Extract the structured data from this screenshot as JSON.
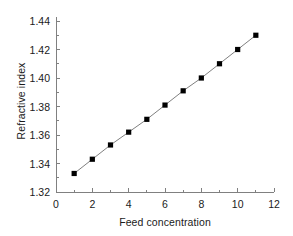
{
  "chart_data": {
    "type": "line",
    "title": "",
    "xlabel": "Feed concentration",
    "ylabel": "Refractive index",
    "x": [
      1,
      2,
      3,
      4,
      5,
      6,
      7,
      8,
      9,
      10,
      11
    ],
    "values": [
      1.333,
      1.343,
      1.353,
      1.362,
      1.371,
      1.381,
      1.391,
      1.4,
      1.41,
      1.42,
      1.43
    ],
    "series": [
      {
        "name": "Refractive index",
        "x": [
          1,
          2,
          3,
          4,
          5,
          6,
          7,
          8,
          9,
          10,
          11
        ],
        "values": [
          1.333,
          1.343,
          1.353,
          1.362,
          1.371,
          1.381,
          1.391,
          1.4,
          1.41,
          1.42,
          1.43
        ],
        "marker": "square",
        "marker_color": "#000000",
        "line_color": "#808080"
      }
    ],
    "xlim": [
      0,
      12
    ],
    "ylim": [
      1.32,
      1.44
    ],
    "xticks": [
      0,
      2,
      4,
      6,
      8,
      10,
      12
    ],
    "xtick_labels": [
      "0",
      "2",
      "4",
      "6",
      "8",
      "10",
      "12"
    ],
    "xminor_ticks": [
      1,
      3,
      5,
      7,
      9,
      11
    ],
    "yticks": [
      1.32,
      1.34,
      1.36,
      1.38,
      1.4,
      1.42,
      1.44
    ],
    "ytick_labels": [
      "1.32",
      "1.34",
      "1.36",
      "1.38",
      "1.40",
      "1.42",
      "1.44"
    ],
    "yminor_ticks": [
      1.33,
      1.35,
      1.37,
      1.39,
      1.41,
      1.43
    ],
    "grid": false,
    "legend": false,
    "legend_position": "none",
    "background_color": "#ffffff",
    "axis_color": "#808080",
    "text_color": "#1a1a1a"
  }
}
